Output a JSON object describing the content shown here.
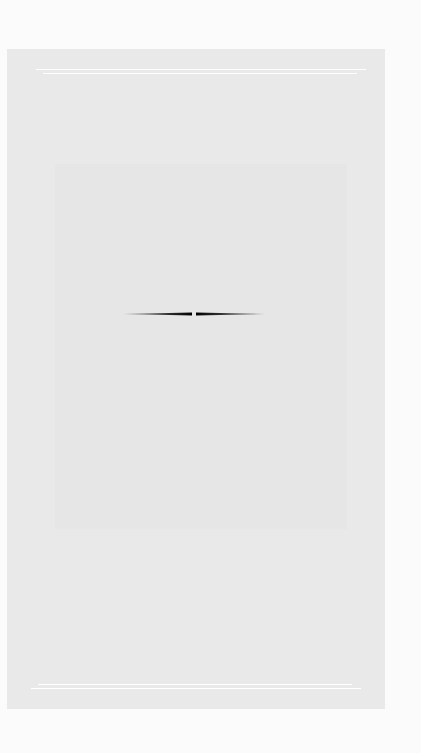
{
  "page": {
    "background": "#fbfbfb",
    "panel_color": "#e9e9e9",
    "rule_color": "#ffffff",
    "ornament": "double-tapered-divider-icon",
    "ornament_color": "#111111"
  }
}
